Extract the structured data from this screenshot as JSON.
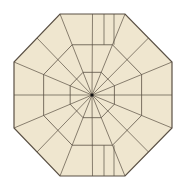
{
  "diagram": {
    "shape": "octagon",
    "fill": "#efe6cf",
    "stroke": "#5a5044",
    "center_dot": "#111111",
    "center": [
      92,
      95
    ],
    "outer_vertices": [
      [
        60,
        14
      ],
      [
        125,
        14
      ],
      [
        172,
        62
      ],
      [
        172,
        128
      ],
      [
        125,
        176
      ],
      [
        60,
        176
      ],
      [
        14,
        128
      ],
      [
        14,
        62
      ]
    ],
    "ring_scales": [
      0.28,
      0.62
    ],
    "ray_count": 16,
    "extra_vertical_lines_x": [
      104,
      114
    ]
  }
}
